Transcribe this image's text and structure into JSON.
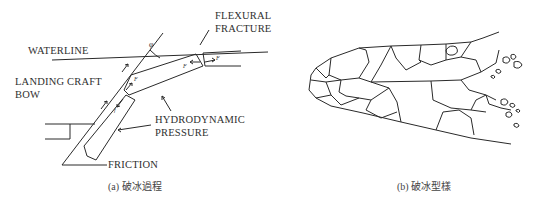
{
  "panel_a": {
    "labels": {
      "flexural_line1": "FLEXURAL",
      "flexural_line2": "FRACTURE",
      "waterline": "WATERLINE",
      "landing_line1": "LANDING CRAFT",
      "landing_line2": "BOW",
      "hydro_line1": "HYDRODYNAMIC",
      "hydro_line2": "PRESSURE",
      "friction": "FRICTION"
    },
    "symbols": {
      "angle": "φ",
      "force": "F",
      "friction_force": "f"
    },
    "caption": "(a) 破冰過程"
  },
  "panel_b": {
    "caption": "(b) 破冰型樣"
  }
}
